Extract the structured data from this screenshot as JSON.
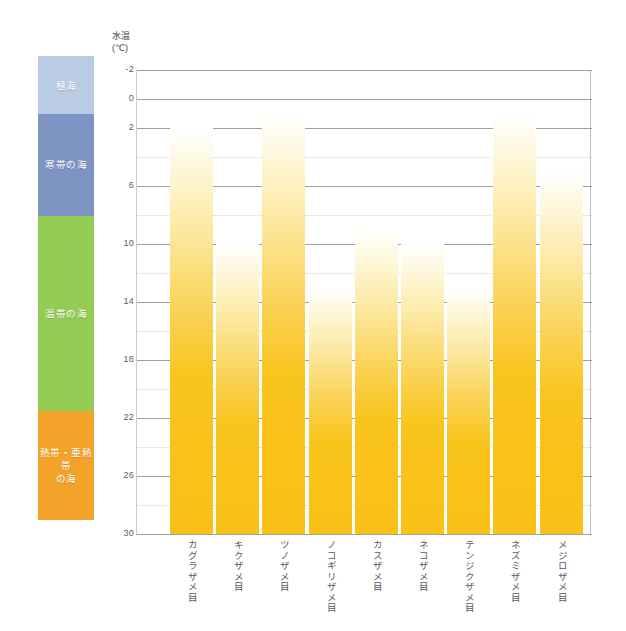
{
  "chart_data": {
    "type": "bar",
    "title": "",
    "ylabel": "水温\n(℃)",
    "xlabel": "",
    "ylim": [
      -2,
      30
    ],
    "y_inverted": true,
    "yticks": [
      -2,
      0,
      2,
      6,
      10,
      14,
      18,
      22,
      26,
      30
    ],
    "yticks_labels": [
      "-2",
      "0",
      "2",
      "6",
      "10",
      "14",
      "18",
      "22",
      "26",
      "30"
    ],
    "minor_gridlines": [
      4,
      8,
      12,
      16,
      20,
      24,
      28
    ],
    "grid": true,
    "legend_position": "none",
    "bar_color": "#f9c116",
    "bar_gradient_top": "#ffffff",
    "note": "各バーは最低水温（上端）から30℃（下端）までの生息水温範囲を示す",
    "categories": [
      "カグラザメ目",
      "キクザメ目",
      "ツノザメ目",
      "ノコギリザメ目",
      "カスザメ目",
      "ネコザメ目",
      "テンジクザメ目",
      "ネズミザメ目",
      "メジロザメ目"
    ],
    "values": [
      2,
      10,
      1,
      13,
      9,
      10,
      13,
      1,
      5
    ],
    "bar_bottom_value": 30,
    "series": [
      {
        "name": "生息水温範囲",
        "tops": [
          2,
          10,
          1,
          13,
          9,
          10,
          13,
          1,
          5
        ],
        "bottoms": [
          30,
          30,
          30,
          30,
          30,
          30,
          30,
          30,
          30
        ]
      }
    ]
  },
  "zones": {
    "label": "海域区分",
    "bands": [
      {
        "name": "極海",
        "label": "極海",
        "color": "#bacbe4",
        "from": -2,
        "to": 2
      },
      {
        "name": "寒帯の海",
        "label": "寒帯の海",
        "color": "#7e95c4",
        "from": 2,
        "to": 9
      },
      {
        "name": "温帯の海",
        "label": "温帯の海",
        "color": "#93cc55",
        "from": 9,
        "to": 22.5
      },
      {
        "name": "熱帯・亜熱帯の海",
        "label": "熱帯・亜熱帯\nの海",
        "color": "#f4a32a",
        "from": 22.5,
        "to": 30
      }
    ]
  }
}
